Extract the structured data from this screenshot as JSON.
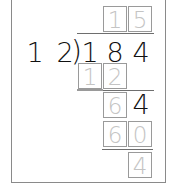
{
  "problem": {
    "divisor": [
      "1",
      "2"
    ],
    "bracket": ")",
    "dividend": [
      "1",
      "8",
      "4"
    ]
  },
  "quotient": [
    "1",
    "5"
  ],
  "steps": {
    "first_product": [
      "1",
      "2"
    ],
    "first_remainder": "6",
    "brought_down": "4",
    "second_product": [
      "6",
      "0"
    ],
    "final_remainder": "4"
  },
  "colors": {
    "given_digits": "#111111",
    "filled_digits": "#c4c4c4",
    "box_border": "#9a9a9a",
    "lines": "#6e6e6e"
  }
}
